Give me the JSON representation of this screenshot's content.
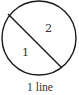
{
  "diagram": {
    "regions": [
      {
        "label": "1"
      },
      {
        "label": "2"
      }
    ],
    "chord_count": 1,
    "caption": "1 line",
    "stroke_color": "#1a1a1a",
    "text_color": "#333333"
  }
}
